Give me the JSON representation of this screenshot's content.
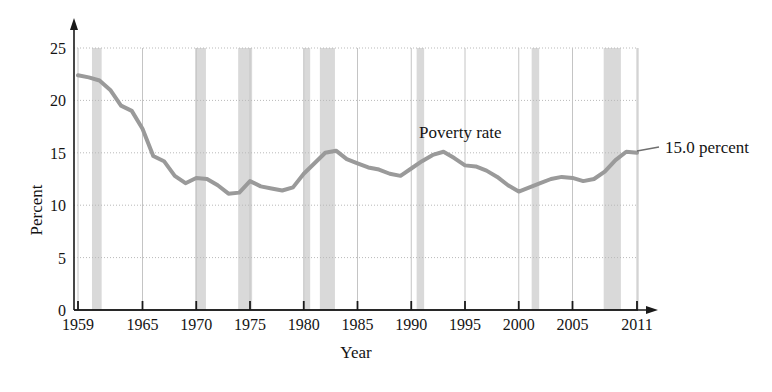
{
  "chart_data": {
    "type": "line",
    "title": "",
    "xlabel": "Year",
    "ylabel": "Percent",
    "xlim": [
      1959,
      2011
    ],
    "ylim": [
      0,
      25
    ],
    "grid": true,
    "legend_position": "inline-annotation",
    "series_name": "Poverty rate",
    "endpoint_annotation": "15.0 percent",
    "x_tick_labels": [
      "1959",
      "1965",
      "1970",
      "1975",
      "1980",
      "1985",
      "1990",
      "1995",
      "2000",
      "2005",
      "2011"
    ],
    "x_ticks": [
      1959,
      1965,
      1970,
      1975,
      1980,
      1985,
      1990,
      1995,
      2000,
      2005,
      2011
    ],
    "y_tick_labels": [
      "0",
      "5",
      "10",
      "15",
      "20",
      "25"
    ],
    "y_ticks": [
      0,
      5,
      10,
      15,
      20,
      25
    ],
    "series": [
      {
        "name": "Poverty rate",
        "color": "#9a9a9a",
        "x": [
          1959,
          1960,
          1961,
          1962,
          1963,
          1964,
          1965,
          1966,
          1967,
          1968,
          1969,
          1970,
          1971,
          1972,
          1973,
          1974,
          1975,
          1976,
          1977,
          1978,
          1979,
          1980,
          1981,
          1982,
          1983,
          1984,
          1985,
          1986,
          1987,
          1988,
          1989,
          1990,
          1991,
          1992,
          1993,
          1994,
          1995,
          1996,
          1997,
          1998,
          1999,
          2000,
          2001,
          2002,
          2003,
          2004,
          2005,
          2006,
          2007,
          2008,
          2009,
          2010,
          2011
        ],
        "values": [
          22.4,
          22.2,
          21.9,
          21.0,
          19.5,
          19.0,
          17.3,
          14.7,
          14.2,
          12.8,
          12.1,
          12.6,
          12.5,
          11.9,
          11.1,
          11.2,
          12.3,
          11.8,
          11.6,
          11.4,
          11.7,
          13.0,
          14.0,
          15.0,
          15.2,
          14.4,
          14.0,
          13.6,
          13.4,
          13.0,
          12.8,
          13.5,
          14.2,
          14.8,
          15.1,
          14.5,
          13.8,
          13.7,
          13.3,
          12.7,
          11.9,
          11.3,
          11.7,
          12.1,
          12.5,
          12.7,
          12.6,
          12.3,
          12.5,
          13.2,
          14.3,
          15.1,
          15.0
        ]
      }
    ],
    "recession_bands": [
      {
        "start": 1960.3,
        "end": 1961.2
      },
      {
        "start": 1969.9,
        "end": 1970.9
      },
      {
        "start": 1973.9,
        "end": 1975.2
      },
      {
        "start": 1980.0,
        "end": 1980.6
      },
      {
        "start": 1981.5,
        "end": 1982.9
      },
      {
        "start": 1990.5,
        "end": 1991.2
      },
      {
        "start": 2001.2,
        "end": 2001.9
      },
      {
        "start": 2007.9,
        "end": 2009.5
      }
    ],
    "recession_band_color": "#d9d9d9"
  }
}
